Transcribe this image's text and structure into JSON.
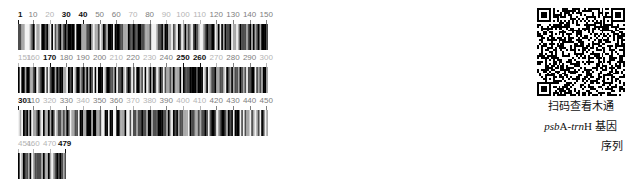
{
  "figure": {
    "kind": "dna-sequence-barcode",
    "total_bases": 479,
    "bases_per_row": 150,
    "bar_width_px": 1.666,
    "base_colors": {
      "A": "#000000",
      "T": "#4d4d4d",
      "G": "#a8a8a8",
      "C": "#f2f2f2"
    },
    "tick_color_bold": "#111111",
    "tick_color_normal": "#808080",
    "tick_color_light": "#b5b5b5"
  },
  "rows": [
    {
      "id": "row-1",
      "start": 1,
      "end": 150,
      "top": 10,
      "width": 486,
      "ticks": [
        {
          "value": "1",
          "pos": 1,
          "weight": "bold"
        },
        {
          "value": "10",
          "pos": 10,
          "weight": "normal"
        },
        {
          "value": "20",
          "pos": 20,
          "weight": "light"
        },
        {
          "value": "30",
          "pos": 30,
          "weight": "bold"
        },
        {
          "value": "40",
          "pos": 40,
          "weight": "bold"
        },
        {
          "value": "50",
          "pos": 50,
          "weight": "normal"
        },
        {
          "value": "60",
          "pos": 60,
          "weight": "normal"
        },
        {
          "value": "70",
          "pos": 70,
          "weight": "light"
        },
        {
          "value": "80",
          "pos": 80,
          "weight": "normal"
        },
        {
          "value": "90",
          "pos": 90,
          "weight": "light"
        },
        {
          "value": "100",
          "pos": 100,
          "weight": "light"
        },
        {
          "value": "110",
          "pos": 110,
          "weight": "light"
        },
        {
          "value": "120",
          "pos": 120,
          "weight": "normal"
        },
        {
          "value": "130",
          "pos": 130,
          "weight": "normal"
        },
        {
          "value": "140",
          "pos": 140,
          "weight": "normal"
        },
        {
          "value": "150",
          "pos": 150,
          "weight": "normal"
        }
      ]
    },
    {
      "id": "row-2",
      "start": 151,
      "end": 300,
      "top": 53,
      "width": 486,
      "ticks": [
        {
          "value": "151",
          "pos": 151,
          "weight": "light"
        },
        {
          "value": "160",
          "pos": 160,
          "weight": "light"
        },
        {
          "value": "170",
          "pos": 170,
          "weight": "bold"
        },
        {
          "value": "180",
          "pos": 180,
          "weight": "normal"
        },
        {
          "value": "190",
          "pos": 190,
          "weight": "normal"
        },
        {
          "value": "200",
          "pos": 200,
          "weight": "normal"
        },
        {
          "value": "210",
          "pos": 210,
          "weight": "light"
        },
        {
          "value": "220",
          "pos": 220,
          "weight": "normal"
        },
        {
          "value": "230",
          "pos": 230,
          "weight": "light"
        },
        {
          "value": "240",
          "pos": 240,
          "weight": "normal"
        },
        {
          "value": "250",
          "pos": 250,
          "weight": "bold"
        },
        {
          "value": "260",
          "pos": 260,
          "weight": "bold"
        },
        {
          "value": "270",
          "pos": 270,
          "weight": "light"
        },
        {
          "value": "280",
          "pos": 280,
          "weight": "normal"
        },
        {
          "value": "290",
          "pos": 290,
          "weight": "normal"
        },
        {
          "value": "300",
          "pos": 300,
          "weight": "light"
        }
      ]
    },
    {
      "id": "row-3",
      "start": 301,
      "end": 450,
      "top": 96,
      "width": 486,
      "ticks": [
        {
          "value": "301",
          "pos": 301,
          "weight": "bold"
        },
        {
          "value": "310",
          "pos": 310,
          "weight": "normal"
        },
        {
          "value": "320",
          "pos": 320,
          "weight": "light"
        },
        {
          "value": "330",
          "pos": 330,
          "weight": "normal"
        },
        {
          "value": "340",
          "pos": 340,
          "weight": "light"
        },
        {
          "value": "350",
          "pos": 350,
          "weight": "normal"
        },
        {
          "value": "360",
          "pos": 360,
          "weight": "normal"
        },
        {
          "value": "370",
          "pos": 370,
          "weight": "light"
        },
        {
          "value": "380",
          "pos": 380,
          "weight": "light"
        },
        {
          "value": "390",
          "pos": 390,
          "weight": "normal"
        },
        {
          "value": "400",
          "pos": 400,
          "weight": "light"
        },
        {
          "value": "410",
          "pos": 410,
          "weight": "light"
        },
        {
          "value": "420",
          "pos": 420,
          "weight": "normal"
        },
        {
          "value": "430",
          "pos": 430,
          "weight": "normal"
        },
        {
          "value": "440",
          "pos": 440,
          "weight": "normal"
        },
        {
          "value": "450",
          "pos": 450,
          "weight": "normal"
        }
      ]
    },
    {
      "id": "row-4",
      "start": 451,
      "end": 479,
      "top": 139,
      "width": 117,
      "ticks": [
        {
          "value": "451",
          "pos": 451,
          "weight": "light"
        },
        {
          "value": "460",
          "pos": 460,
          "weight": "light"
        },
        {
          "value": "470",
          "pos": 470,
          "weight": "light"
        },
        {
          "value": "479",
          "pos": 479,
          "weight": "bold"
        }
      ]
    }
  ],
  "qr": {
    "name": "qr-code",
    "modules": 45,
    "dark": "#000000",
    "light": "#ffffff"
  },
  "caption": {
    "line1": "扫码查看木通",
    "line2_italic_1": "psb",
    "line2_roman_1": "A-",
    "line2_italic_2": "trn",
    "line2_roman_2": "H 基因",
    "line3": "序列"
  }
}
